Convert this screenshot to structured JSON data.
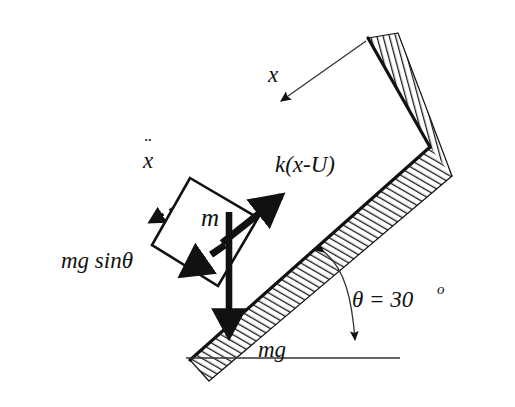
{
  "figure": {
    "background_color": "#ffffff",
    "ink_color": "#111111",
    "hatch_color": "#1a1a1a"
  },
  "labels": {
    "displacement_x": "x",
    "acceleration_x": "x",
    "acceleration_dots": "¨",
    "spring_force": "k(x-U)",
    "gravity_component": "mg sinθ",
    "mass": "m",
    "weight": "mg",
    "angle_symbol": "θ = 30",
    "angle_degree_mark": "o",
    "angle_full": "θ = 30º"
  },
  "geometry": {
    "incline_angle_degrees": 30,
    "incline_label": "30",
    "baseline_label": "horizontal ground line"
  },
  "vectors": [
    {
      "name": "displacement-x-arrow",
      "label": "x",
      "style": "thin-solid",
      "direction": "down-left",
      "from": "wall top corner",
      "to": "free space"
    },
    {
      "name": "acceleration-x-arrow",
      "label": "x",
      "style": "dashed",
      "direction": "down-left",
      "notation": "double-dot"
    },
    {
      "name": "spring-force-arrow",
      "label": "k(x-U)",
      "style": "thick-solid",
      "direction": "up-slope"
    },
    {
      "name": "gravity-component-arrow",
      "label": "mg sinθ",
      "style": "thick-dashed",
      "direction": "down-slope"
    },
    {
      "name": "weight-arrow",
      "label": "mg",
      "style": "thick-solid",
      "direction": "straight-down"
    },
    {
      "name": "angle-arc-arrow",
      "label": "θ = 30º",
      "style": "thin-curved-double-headed",
      "direction": "from incline surface to horizontal"
    }
  ],
  "shapes": [
    {
      "name": "inclined-surface",
      "fill": "hatched",
      "orientation": "30-degree incline"
    },
    {
      "name": "vertical-wall",
      "fill": "hatched",
      "orientation": "steep wall at top right"
    },
    {
      "name": "mass-block",
      "fill": "white",
      "stroke": "black",
      "label": "m"
    },
    {
      "name": "ground-baseline",
      "fill": "none",
      "stroke": "black"
    }
  ]
}
